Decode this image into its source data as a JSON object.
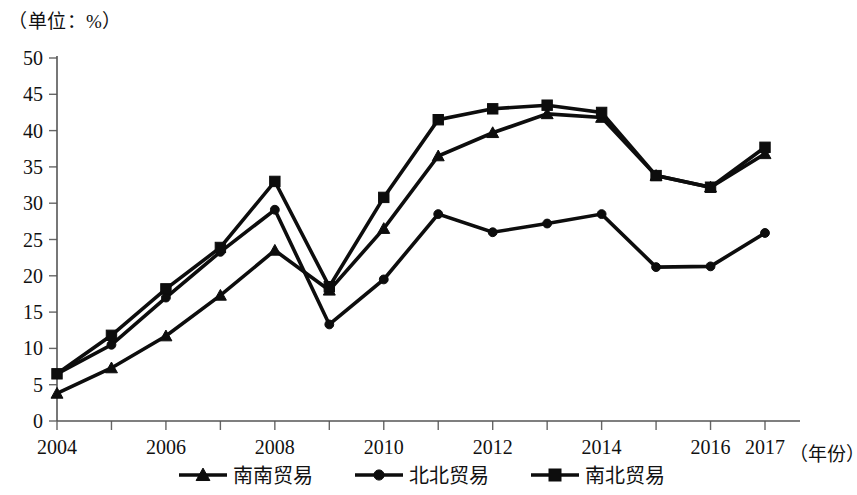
{
  "unit_label": "（单位：%）",
  "xaxis_title": "（年份）",
  "chart_data": {
    "type": "line",
    "title": "",
    "subtitle": "",
    "xlabel": "（年份）",
    "ylabel": "（单位：%）",
    "grid": false,
    "legend_position": "bottom",
    "ylim": [
      0,
      50
    ],
    "xlim": [
      2004,
      2017
    ],
    "ytick_labels": [
      "0",
      "5",
      "10",
      "15",
      "20",
      "25",
      "30",
      "35",
      "40",
      "45",
      "50"
    ],
    "ytick_values": [
      0,
      5,
      10,
      15,
      20,
      25,
      30,
      35,
      40,
      45,
      50
    ],
    "x": [
      2004,
      2005,
      2006,
      2007,
      2008,
      2009,
      2010,
      2011,
      2012,
      2013,
      2014,
      2015,
      2016,
      2017
    ],
    "xtick_labels": [
      "2004",
      "2006",
      "2008",
      "2010",
      "2012",
      "2014",
      "2016",
      "2017"
    ],
    "xtick_values": [
      2004,
      2006,
      2008,
      2010,
      2012,
      2014,
      2016,
      2017
    ],
    "series": [
      {
        "name": "南南贸易",
        "marker": "triangle",
        "values": [
          3.8,
          7.3,
          11.7,
          17.3,
          23.5,
          18.0,
          26.5,
          36.5,
          39.7,
          42.3,
          41.8,
          33.8,
          32.2,
          36.8
        ]
      },
      {
        "name": "北北贸易",
        "marker": "circle",
        "values": [
          6.5,
          10.5,
          17.0,
          23.3,
          29.1,
          13.3,
          19.5,
          28.5,
          26.0,
          27.2,
          28.5,
          21.2,
          21.3,
          25.9
        ]
      },
      {
        "name": "南北贸易",
        "marker": "square",
        "values": [
          6.5,
          11.8,
          18.2,
          23.9,
          33.0,
          18.5,
          30.8,
          41.5,
          43.0,
          43.5,
          42.5,
          33.8,
          32.2,
          37.7
        ]
      }
    ]
  },
  "legend": {
    "items": [
      {
        "label": "南南贸易",
        "marker": "triangle"
      },
      {
        "label": "北北贸易",
        "marker": "circle"
      },
      {
        "label": "南北贸易",
        "marker": "square"
      }
    ]
  }
}
